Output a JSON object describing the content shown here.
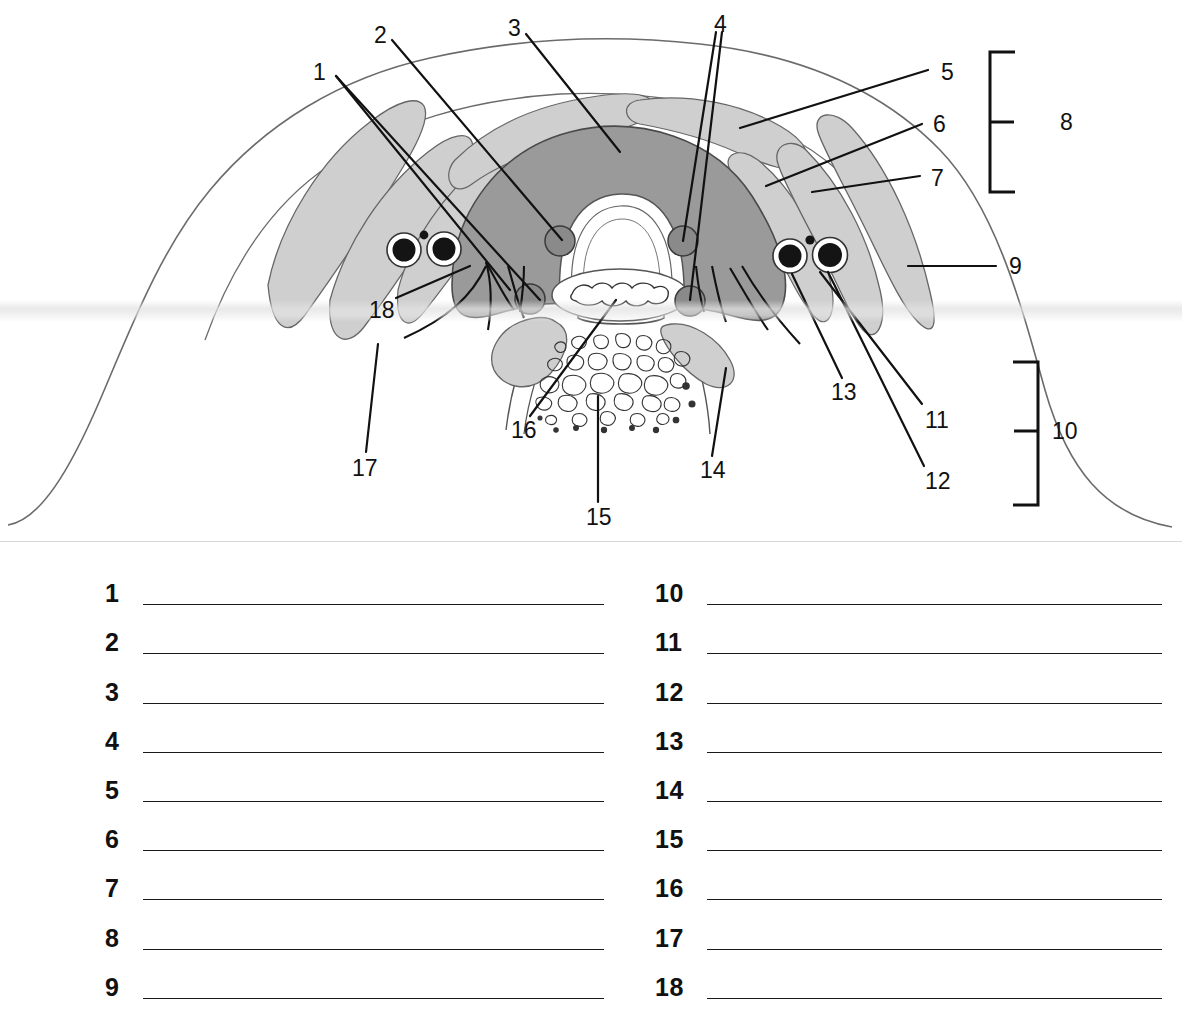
{
  "worksheet": {
    "title": "Anatomical cross-section labeling worksheet",
    "figure_caption": ""
  },
  "figure": {
    "type": "anatomical-cross-section",
    "region": "neck transverse section",
    "colors": {
      "outline": "#555555",
      "dark_gray_fill": "#9a9a9a",
      "light_gray_fill": "#cfcfcf",
      "vessel_fill": "#111111",
      "leader_line": "#111111",
      "paper": "#ffffff"
    },
    "labels": [
      {
        "n": "1",
        "x": 313,
        "y": 61,
        "leaders": 2
      },
      {
        "n": "2",
        "x": 374,
        "y": 24,
        "leaders": 1
      },
      {
        "n": "3",
        "x": 508,
        "y": 17,
        "leaders": 1
      },
      {
        "n": "4",
        "x": 714,
        "y": 13,
        "leaders": 2
      },
      {
        "n": "5",
        "x": 941,
        "y": 61,
        "leaders": 1
      },
      {
        "n": "6",
        "x": 933,
        "y": 113,
        "leaders": 1
      },
      {
        "n": "7",
        "x": 931,
        "y": 167,
        "leaders": 1
      },
      {
        "n": "8",
        "x": 1060,
        "y": 113,
        "leaders": 0,
        "bracket": true
      },
      {
        "n": "9",
        "x": 1009,
        "y": 258,
        "leaders": 1
      },
      {
        "n": "10",
        "x": 1041,
        "y": 422,
        "leaders": 0,
        "bracket": true
      },
      {
        "n": "11",
        "x": 925,
        "y": 414,
        "leaders": 1
      },
      {
        "n": "12",
        "x": 925,
        "y": 475,
        "leaders": 1
      },
      {
        "n": "13",
        "x": 833,
        "y": 386,
        "leaders": 1
      },
      {
        "n": "14",
        "x": 702,
        "y": 464,
        "leaders": 1
      },
      {
        "n": "15",
        "x": 589,
        "y": 511,
        "leaders": 1
      },
      {
        "n": "16",
        "x": 513,
        "y": 424,
        "leaders": 1
      },
      {
        "n": "17",
        "x": 354,
        "y": 462,
        "leaders": 1
      },
      {
        "n": "18",
        "x": 371,
        "y": 305,
        "leaders": 1
      }
    ]
  },
  "answers": {
    "left_column": [
      {
        "number": "1",
        "value": ""
      },
      {
        "number": "2",
        "value": ""
      },
      {
        "number": "3",
        "value": ""
      },
      {
        "number": "4",
        "value": ""
      },
      {
        "number": "5",
        "value": ""
      },
      {
        "number": "6",
        "value": ""
      },
      {
        "number": "7",
        "value": ""
      },
      {
        "number": "8",
        "value": ""
      },
      {
        "number": "9",
        "value": ""
      }
    ],
    "right_column": [
      {
        "number": "10",
        "value": ""
      },
      {
        "number": "11",
        "value": ""
      },
      {
        "number": "12",
        "value": ""
      },
      {
        "number": "13",
        "value": ""
      },
      {
        "number": "14",
        "value": ""
      },
      {
        "number": "15",
        "value": ""
      },
      {
        "number": "16",
        "value": ""
      },
      {
        "number": "17",
        "value": ""
      },
      {
        "number": "18",
        "value": ""
      }
    ]
  }
}
